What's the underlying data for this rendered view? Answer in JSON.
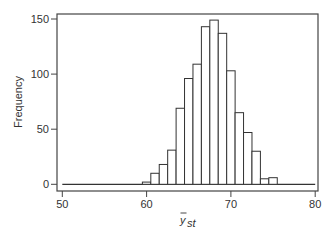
{
  "chart_data": {
    "type": "bar",
    "subtype": "histogram",
    "title": "",
    "xlabel": "ȳ_st",
    "xlabel_main": "y",
    "xlabel_sub": "st",
    "ylabel": "Frequency",
    "xlim": [
      50,
      80
    ],
    "ylim": [
      0,
      150
    ],
    "x_ticks": [
      50,
      60,
      70,
      80
    ],
    "y_ticks": [
      0,
      50,
      100,
      150
    ],
    "bin_width": 1,
    "categories": [
      60,
      61,
      62,
      63,
      64,
      65,
      66,
      67,
      68,
      69,
      70,
      71,
      72,
      73,
      74,
      75
    ],
    "values": [
      2,
      10,
      18,
      31,
      69,
      96,
      109,
      143,
      149,
      137,
      103,
      65,
      47,
      30,
      5,
      6
    ],
    "grid": false,
    "legend": null,
    "bar_fill": "#ffffff",
    "bar_stroke": "#333333"
  }
}
